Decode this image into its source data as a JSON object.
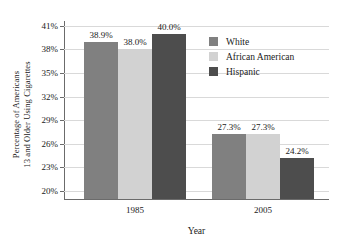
{
  "chart_data": {
    "type": "bar",
    "title": "",
    "xlabel": "Year",
    "ylabel": "Percentage of Americans 13 and Older Using Cigarettes",
    "ylabel_line1": "Percentage of Americans",
    "ylabel_line2": "13 and Older Using Cigarettes",
    "categories": [
      "1985",
      "2005"
    ],
    "series": [
      {
        "name": "White",
        "values": [
          38.9,
          27.3
        ],
        "color": "#808080"
      },
      {
        "name": "African American",
        "values": [
          38.0,
          27.3
        ],
        "color": "#d2d2d2"
      },
      {
        "name": "Hispanic",
        "values": [
          40.0,
          24.2
        ],
        "color": "#4d4d4d"
      }
    ],
    "data_labels": [
      [
        "38.9%",
        "38.0%",
        "40.0%"
      ],
      [
        "27.3%",
        "27.3%",
        "24.2%"
      ]
    ],
    "ylim": [
      19.0,
      41.6
    ],
    "yticks": [
      41,
      38,
      35,
      32,
      29,
      26,
      23,
      20
    ],
    "ytick_labels": [
      "41%",
      "38%",
      "35%",
      "32%",
      "29%",
      "26%",
      "23%",
      "20%"
    ],
    "grid": true,
    "legend_position": "inside-right",
    "axis_color": "#6b6b6b",
    "grid_color": "#d9d9d9"
  }
}
